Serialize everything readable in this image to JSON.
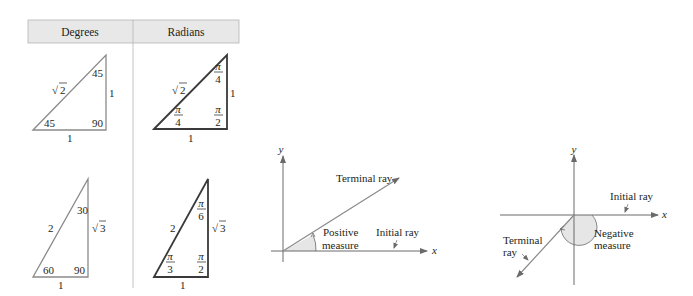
{
  "table": {
    "headers": [
      "Degrees",
      "Radians"
    ],
    "header_bg": "#e8e8e8",
    "degrees": {
      "triangle_45": {
        "hyp": "2",
        "leg_right": "1",
        "leg_bottom": "1",
        "angle_top": "45",
        "angle_left": "45",
        "angle_right": "90"
      },
      "triangle_30_60": {
        "hyp": "2",
        "leg_right": "3",
        "leg_bottom": "1",
        "angle_top": "30",
        "angle_left": "60",
        "angle_right": "90"
      }
    },
    "radians": {
      "triangle_45": {
        "hyp": "2",
        "leg_right": "1",
        "leg_bottom": "1",
        "angle_top": {
          "num": "π",
          "den": "4"
        },
        "angle_left": {
          "num": "π",
          "den": "4"
        },
        "angle_right": {
          "num": "π",
          "den": "2"
        }
      },
      "triangle_30_60": {
        "hyp": "2",
        "leg_right": "3",
        "leg_bottom": "1",
        "angle_top": {
          "num": "π",
          "den": "6"
        },
        "angle_left": {
          "num": "π",
          "den": "3"
        },
        "angle_right": {
          "num": "π",
          "den": "2"
        }
      }
    },
    "sqrt_symbol": "√"
  },
  "positive_angle": {
    "x_axis": "x",
    "y_axis": "y",
    "terminal_label": "Terminal ray",
    "initial_label": "Initial ray",
    "measure_line1": "Positive",
    "measure_line2": "measure"
  },
  "negative_angle": {
    "x_axis": "x",
    "y_axis": "y",
    "terminal_line1": "Terminal",
    "terminal_line2": "ray",
    "initial_label": "Initial ray",
    "measure_line1": "Negative",
    "measure_line2": "measure"
  },
  "colors": {
    "gray_line": "#8a8a8a",
    "dark_line": "#3a3a3a",
    "shade": "#e6e6e6"
  }
}
